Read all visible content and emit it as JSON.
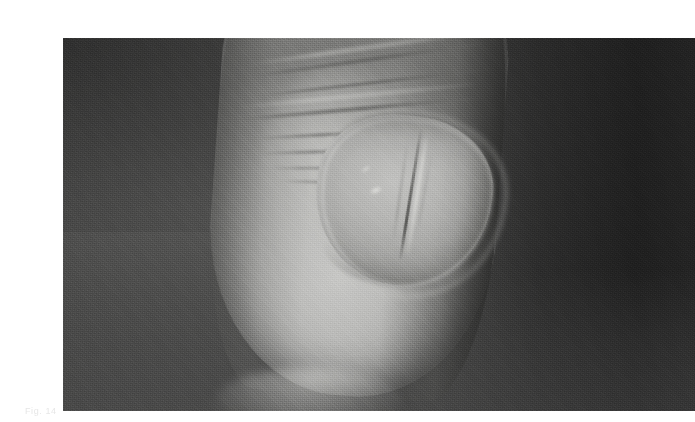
{
  "page": {
    "background_color": "#ffffff",
    "width": 678,
    "height": 422
  },
  "figure": {
    "kind": "photograph",
    "colors": {
      "backdrop_dark": "#343434",
      "backdrop_mid": "#4a4a49",
      "backdrop_light": "#555554",
      "skin_highlight": "#c9c9c7",
      "skin_midtone": "#a3a3a1",
      "skin_shadow": "#6a6a68",
      "nail_plate": "#b6b6b4",
      "nail_rim": "#d6d6d3",
      "nail_ridge_shadow": "#545452"
    },
    "frame": {
      "left": 23,
      "top": 22,
      "width": 632,
      "height": 373
    },
    "features": [
      {
        "name": "knuckle-creases",
        "count": 7,
        "region": "upper-centre"
      },
      {
        "name": "nail-plate",
        "region": "lower-centre"
      },
      {
        "name": "nail-longitudinal-ridge",
        "region": "nail, right of midline"
      },
      {
        "name": "cuticle-shadow-arc",
        "region": "top of nail"
      },
      {
        "name": "free-edge-shadow-arc",
        "region": "bottom of nail"
      },
      {
        "name": "specular-highlight",
        "region": "left flank of finger"
      },
      {
        "name": "deep-shadow-band",
        "region": "right of finger"
      }
    ]
  },
  "caption": {
    "text": "Fig. 14"
  }
}
